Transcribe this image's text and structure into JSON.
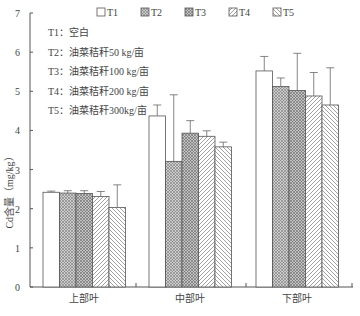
{
  "chart_data": {
    "type": "bar",
    "title": "",
    "xlabel": "",
    "ylabel": "Cd含量（mg/kg）",
    "ylim": [
      0,
      7
    ],
    "yticks": [
      0,
      1,
      2,
      3,
      4,
      5,
      6,
      7
    ],
    "grid": false,
    "legend_position": "top",
    "categories": [
      "上部叶",
      "中部叶",
      "下部叶"
    ],
    "series": [
      {
        "name": "T1",
        "pattern": "none",
        "values": [
          2.42,
          4.37,
          5.52
        ],
        "errors": [
          0.03,
          0.28,
          0.37
        ]
      },
      {
        "name": "T2",
        "pattern": "crosshatch",
        "values": [
          2.4,
          3.21,
          5.12
        ],
        "errors": [
          0.06,
          1.7,
          0.22
        ]
      },
      {
        "name": "T3",
        "pattern": "crosshatch",
        "values": [
          2.39,
          3.93,
          5.02
        ],
        "errors": [
          0.07,
          0.32,
          0.95
        ]
      },
      {
        "name": "T4",
        "pattern": "forward-diagonal",
        "values": [
          2.31,
          3.85,
          4.88
        ],
        "errors": [
          0.13,
          0.14,
          0.6
        ]
      },
      {
        "name": "T5",
        "pattern": "backward-diagonal",
        "values": [
          2.03,
          3.58,
          4.65
        ],
        "errors": [
          0.58,
          0.12,
          0.95
        ]
      }
    ],
    "annotations": [
      "T1：空白",
      "T2：油菜秸秆50 kg/亩",
      "T3：油菜秸秆100 kg/亩",
      "T4：油菜秸秆200 kg/亩",
      "T5：油菜秸秆300kg/亩"
    ]
  },
  "legend": [
    "T1",
    "T2",
    "T3",
    "T4",
    "T5"
  ],
  "notes": [
    "T1：空白",
    "T2：油菜秸秆50 kg/亩",
    "T3：油菜秸秆100 kg/亩",
    "T4：油菜秸秆200 kg/亩",
    "T5：油菜秸秆300kg/亩"
  ],
  "axis": {
    "ylabel": "Cd含量（mg/kg）",
    "xcats": [
      "上部叶",
      "中部叶",
      "下部叶"
    ],
    "yticks": [
      "0",
      "1",
      "2",
      "3",
      "4",
      "5",
      "6",
      "7"
    ]
  }
}
